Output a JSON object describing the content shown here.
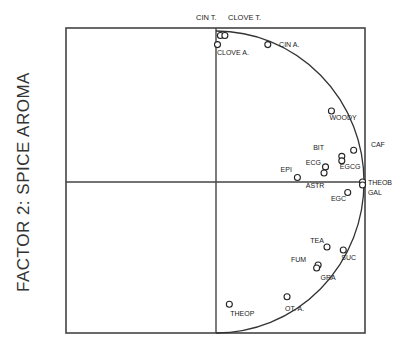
{
  "chart_data": {
    "type": "scatter",
    "title": "",
    "xlabel": "",
    "ylabel": "FACTOR 2:  SPICE AROMA",
    "top_labels": [
      "CIN T.",
      "CLOVE T."
    ],
    "xlim": [
      -1,
      1
    ],
    "ylim": [
      -1,
      1
    ],
    "grid": false,
    "axes_cross_at": [
      0,
      0
    ],
    "unit_circle_arc": true,
    "points": [
      {
        "label": "CIN T.",
        "x": 0.03,
        "y": 0.97,
        "lx": 0.0,
        "ly": 1.04,
        "show_label": false
      },
      {
        "label": "CLOVE T.",
        "x": 0.06,
        "y": 0.97,
        "show_label": false
      },
      {
        "label": "CLOVE A.",
        "x": 0.01,
        "y": 0.91,
        "lx": 0.02,
        "ly": 0.86
      },
      {
        "label": "CIN A.",
        "x": 0.35,
        "y": 0.91,
        "lx": 0.44,
        "ly": 0.91
      },
      {
        "label": "WOODY",
        "x": 0.78,
        "y": 0.47,
        "lx": 0.78,
        "ly": 0.43
      },
      {
        "label": "BIT",
        "x": 0.85,
        "y": 0.17,
        "lx": 0.67,
        "ly": 0.23
      },
      {
        "label": "CAF",
        "x": 0.93,
        "y": 0.21,
        "lx": 1.06,
        "ly": 0.25
      },
      {
        "label": "EGCG",
        "x": 0.85,
        "y": 0.14,
        "lx": 0.85,
        "ly": 0.1
      },
      {
        "label": "ECG",
        "x": 0.74,
        "y": 0.1,
        "lx": 0.62,
        "ly": 0.13
      },
      {
        "label": "EPI",
        "x": 0.55,
        "y": 0.03,
        "lx": 0.45,
        "ly": 0.08
      },
      {
        "label": "ASTR",
        "x": 0.73,
        "y": 0.06,
        "lx": 0.62,
        "ly": -0.02
      },
      {
        "label": "THEOB",
        "x": 0.99,
        "y": 0.0,
        "lx": 1.04,
        "ly": 0.0
      },
      {
        "label": "GAL",
        "x": 0.99,
        "y": -0.02,
        "lx": 1.04,
        "ly": -0.07
      },
      {
        "label": "EGC",
        "x": 0.89,
        "y": -0.07,
        "lx": 0.79,
        "ly": -0.11
      },
      {
        "label": "TEA",
        "x": 0.75,
        "y": -0.43,
        "lx": 0.65,
        "ly": -0.39
      },
      {
        "label": "SUC",
        "x": 0.86,
        "y": -0.45,
        "lx": 0.86,
        "ly": -0.5
      },
      {
        "label": "FUM",
        "x": 0.69,
        "y": -0.55,
        "lx": 0.52,
        "ly": -0.51
      },
      {
        "label": "GRA",
        "x": 0.68,
        "y": -0.57,
        "lx": 0.72,
        "ly": -0.63
      },
      {
        "label": "OT. A.",
        "x": 0.48,
        "y": -0.76,
        "lx": 0.48,
        "ly": -0.84
      },
      {
        "label": "THEOP",
        "x": 0.09,
        "y": -0.81,
        "lx": 0.11,
        "ly": -0.87
      }
    ]
  },
  "labels": {
    "ylabel": "FACTOR 2:  SPICE AROMA",
    "top_left": "CIN T.",
    "top_right": "CLOVE T."
  }
}
